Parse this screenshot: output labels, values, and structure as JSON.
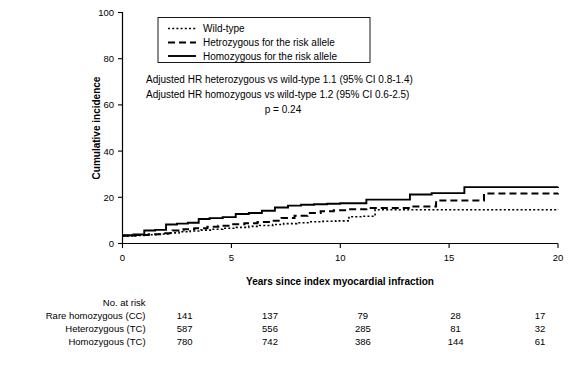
{
  "chart_data": {
    "type": "line",
    "title": "",
    "xlabel": "Years since index myocardial infraction",
    "ylabel": "Cumulative incidence",
    "xlim": [
      0,
      20
    ],
    "ylim": [
      0,
      100
    ],
    "xticks": [
      0,
      5,
      10,
      15,
      20
    ],
    "yticks": [
      0,
      20,
      40,
      60,
      80,
      100
    ],
    "grid": false,
    "legend_position": "top-left-inside",
    "step_type": "post",
    "series": [
      {
        "name": "Wild-type",
        "style": "dotted",
        "x": [
          0,
          0.5,
          1.0,
          1.6,
          2.2,
          2.6,
          3.1,
          3.6,
          4.1,
          4.6,
          5.2,
          5.8,
          6.3,
          6.9,
          7.4,
          8.0,
          8.6,
          9.2,
          9.8,
          10.4,
          11.0,
          11.6,
          20.0
        ],
        "y": [
          3.3,
          3.5,
          3.8,
          4.1,
          4.6,
          5.1,
          5.4,
          5.8,
          6.2,
          6.6,
          7.0,
          7.4,
          7.8,
          8.2,
          8.6,
          9.0,
          9.4,
          9.6,
          9.8,
          11.6,
          11.8,
          14.6,
          14.8
        ]
      },
      {
        "name": "Hetrozygous for the risk allele",
        "style": "dashed",
        "x": [
          0,
          0.6,
          1.2,
          1.8,
          2.3,
          2.8,
          3.3,
          3.9,
          4.4,
          5.0,
          5.6,
          6.2,
          6.8,
          7.3,
          7.9,
          8.5,
          9.1,
          9.7,
          10.3,
          11.2,
          13.2,
          14.4,
          16.6,
          20.0
        ],
        "y": [
          3.4,
          3.7,
          4.0,
          4.4,
          5.6,
          6.2,
          6.6,
          7.2,
          7.7,
          8.3,
          8.8,
          9.3,
          9.8,
          11.0,
          12.0,
          13.2,
          14.0,
          14.4,
          14.8,
          15.4,
          16.0,
          18.6,
          21.6,
          21.8
        ]
      },
      {
        "name": "Homozygous for the risk allele",
        "style": "solid",
        "x": [
          0,
          0.5,
          1.0,
          1.5,
          2.0,
          2.5,
          3.0,
          3.5,
          4.0,
          4.6,
          5.2,
          5.8,
          6.4,
          7.0,
          7.6,
          8.2,
          8.8,
          9.4,
          10.0,
          11.2,
          13.2,
          14.2,
          15.7,
          20.0
        ],
        "y": [
          3.6,
          3.9,
          5.6,
          5.9,
          8.2,
          8.6,
          9.0,
          10.6,
          11.0,
          11.4,
          12.8,
          13.2,
          14.2,
          15.6,
          16.4,
          16.8,
          17.0,
          17.2,
          17.4,
          19.0,
          21.2,
          21.8,
          24.4,
          24.6
        ]
      }
    ],
    "annotations": [
      "Adjusted HR heterozygous vs wild-type 1.1 (95% CI 0.8-1.4)",
      "Adjusted HR homozygous vs wild-type 1.2 (95% CI 0.6-2.5)",
      "p = 0.24"
    ]
  },
  "legend": {
    "items": [
      {
        "label": "Wild-type",
        "style": "dotted"
      },
      {
        "label": "Hetrozygous for the risk allele",
        "style": "dashed"
      },
      {
        "label": "Homozygous for the risk allele",
        "style": "solid"
      }
    ]
  },
  "risk_table": {
    "heading": "No. at risk",
    "columns": [
      "0",
      "5",
      "10",
      "15",
      "20"
    ],
    "rows": [
      {
        "label": "Rare homozygous (CC)",
        "values": [
          "141",
          "137",
          "79",
          "28",
          "17"
        ]
      },
      {
        "label": "Heterozygous (TC)",
        "values": [
          "587",
          "556",
          "285",
          "81",
          "32"
        ]
      },
      {
        "label": "Homozygous (TC)",
        "values": [
          "780",
          "742",
          "386",
          "144",
          "61"
        ]
      }
    ]
  },
  "axes": {
    "x_label": "Years since index myocardial infraction",
    "y_label": "Cumulative incidence",
    "x_ticks": [
      "0",
      "5",
      "10",
      "15",
      "20"
    ],
    "y_ticks": [
      "0",
      "20",
      "40",
      "60",
      "80",
      "100"
    ]
  },
  "colors": {
    "line": "#000000",
    "background": "#ffffff"
  }
}
